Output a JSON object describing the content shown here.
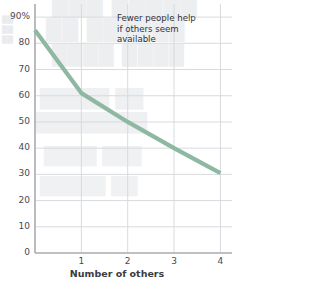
{
  "chart_data": {
    "type": "line",
    "title": "",
    "xlabel": "Number of others",
    "ylabel": "",
    "x": [
      0,
      1,
      2,
      3,
      4
    ],
    "values": [
      85,
      61,
      50,
      40,
      30.5
    ],
    "series": [
      {
        "name": "Percent who help",
        "values": [
          85,
          61,
          50,
          40,
          30.5
        ]
      }
    ],
    "xlim": [
      0,
      4.25
    ],
    "ylim": [
      0,
      95
    ],
    "xticks": [
      "1",
      "2",
      "3",
      "4"
    ],
    "xtick_values": [
      1,
      2,
      3,
      4
    ],
    "yticks": [
      "90%",
      "80",
      "70",
      "60",
      "50",
      "40",
      "30",
      "20",
      "10",
      "0"
    ],
    "ytick_values": [
      90,
      80,
      70,
      60,
      50,
      40,
      30,
      20,
      10,
      0
    ],
    "grid": true,
    "legend": false,
    "annotations": [
      {
        "text": "Fewer people help\nif others seem\navailable",
        "x": 1.9,
        "y": 92
      }
    ],
    "line_color": "#8fb8a3",
    "grid_color": "#d8dade",
    "axis_color": "#a9abb0",
    "tick_text_color": "#4a4a52",
    "annotation_color": "#32323a"
  },
  "axis": {
    "x_label": "Number of others"
  },
  "annotation": {
    "line1": "Fewer people help",
    "line2": "if others seem",
    "line3": "available"
  },
  "bleed": {
    "l1": "███ █████",
    "l2": "██ ██████",
    "l3": "████ ████",
    "l4": "█████ ██",
    "l5": "████████",
    "l6": "████ ███",
    "l7": "█████ ██",
    "l8": "██",
    "l9": "██",
    "l10": "██"
  }
}
